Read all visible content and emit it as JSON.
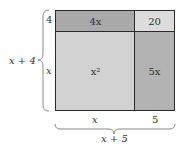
{
  "diagram": {
    "type": "area-model",
    "cells": {
      "top_left": "4x",
      "top_right": "20",
      "bottom_left": "x²",
      "bottom_right": "5x"
    },
    "left_labels": {
      "top": "4",
      "bottom": "x"
    },
    "bottom_labels": {
      "left": "x",
      "right": "5"
    },
    "brace_labels": {
      "height": "x + 4",
      "width": "x + 5"
    },
    "colors": {
      "top_left": "#a9a9a9",
      "top_right": "#dcdcdc",
      "bottom_left": "#d2d2d2",
      "bottom_right": "#b3b3b3",
      "border": "#2a2a2a"
    }
  }
}
